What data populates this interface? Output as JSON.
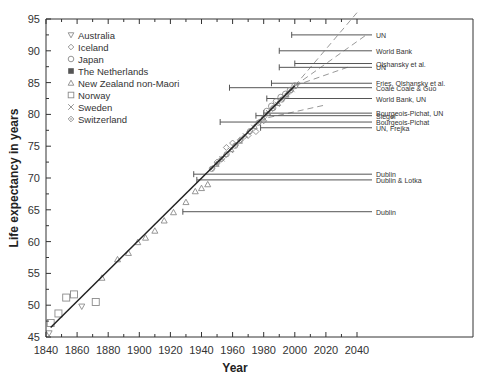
{
  "chart_data": {
    "type": "scatter",
    "title": "",
    "xlabel": "Year",
    "ylabel": "Life expectancy in years",
    "xlim": [
      1840,
      2040
    ],
    "ylim": [
      45,
      95
    ],
    "xticks": [
      1840,
      1860,
      1880,
      1900,
      1920,
      1940,
      1960,
      1980,
      2000,
      2020,
      2040
    ],
    "yticks": [
      45,
      50,
      55,
      60,
      65,
      70,
      75,
      80,
      85,
      90,
      95
    ],
    "grid": false,
    "legend_position": "upper-left",
    "legend": [
      {
        "name": "Australia",
        "marker": "triangle-down"
      },
      {
        "name": "Iceland",
        "marker": "diamond-open"
      },
      {
        "name": "Japan",
        "marker": "circle-open"
      },
      {
        "name": "The Netherlands",
        "marker": "square-filled"
      },
      {
        "name": "New Zealand non-Maori",
        "marker": "triangle-up"
      },
      {
        "name": "Norway",
        "marker": "square-open"
      },
      {
        "name": "Sweden",
        "marker": "x"
      },
      {
        "name": "Switzerland",
        "marker": "diamond-dot"
      }
    ],
    "trend_line": {
      "x": [
        1843,
        2000
      ],
      "y": [
        46.5,
        84.5
      ]
    },
    "series": [
      {
        "name": "Norway",
        "x": [
          1843,
          1848,
          1853,
          1858,
          1872
        ],
        "y": [
          47.2,
          48.7,
          51.2,
          51.7,
          50.5
        ]
      },
      {
        "name": "Australia",
        "x": [
          1842,
          1863
        ],
        "y": [
          45.6,
          49.8
        ]
      },
      {
        "name": "New Zealand non-Maori",
        "x": [
          1876,
          1886,
          1893,
          1899,
          1904,
          1910,
          1916,
          1922,
          1930,
          1936,
          1940,
          1944
        ],
        "y": [
          54.3,
          57.2,
          58.2,
          59.9,
          60.6,
          61.7,
          63.3,
          64.6,
          66.2,
          67.9,
          68.4,
          69.0
        ]
      },
      {
        "name": "Iceland",
        "x": [
          1950,
          1953,
          1956,
          1960,
          1965,
          1970,
          1975,
          1980
        ],
        "y": [
          72.5,
          73.0,
          74.8,
          75.5,
          76.0,
          76.7,
          77.3,
          79.0
        ]
      },
      {
        "name": "Japan",
        "x": [
          1982,
          1985,
          1988,
          1991,
          1994,
          1997,
          2000
        ],
        "y": [
          80.5,
          81.3,
          82.0,
          82.7,
          83.2,
          83.8,
          84.5
        ]
      }
    ],
    "projections": [
      {
        "label": "UN",
        "x_start": 1998,
        "level": 92.5
      },
      {
        "label": "World Bank",
        "x_start": 1990,
        "level": 90.0
      },
      {
        "label": "Olshansky et al.",
        "x_start": 2000,
        "level": 88.0
      },
      {
        "label": "UN",
        "x_start": 1990,
        "level": 87.4
      },
      {
        "label": "Fries, Olshansky et al.",
        "x_start": 1985,
        "level": 84.9
      },
      {
        "label": "Coale   Coale & Guo",
        "x_start": 1958,
        "level": 84.2
      },
      {
        "label": "World Bank, UN",
        "x_start": 1982,
        "level": 82.5
      },
      {
        "label": "Bourgeois-Pichat, UN",
        "x_start": 1980,
        "level": 80.2
      },
      {
        "label": "Siegel",
        "x_start": 1975,
        "level": 79.8
      },
      {
        "label": "Bourgeois-Pichat",
        "x_start": 1952,
        "level": 78.8
      },
      {
        "label": "UN, Frejka",
        "x_start": 1978,
        "level": 77.9
      },
      {
        "label": "Dublin",
        "x_start": 1935,
        "level": 70.6
      },
      {
        "label": "Dublin & Lotka",
        "x_start": 1937,
        "level": 69.7
      },
      {
        "label": "Dublin",
        "x_start": 1928,
        "level": 64.7
      }
    ],
    "dashed_extrapolations": [
      {
        "x": [
          2000,
          2040
        ],
        "y": [
          84.5,
          96
        ]
      },
      {
        "x": [
          2000,
          2046
        ],
        "y": [
          84.5,
          92.5
        ]
      },
      {
        "x": [
          2000,
          2035
        ],
        "y": [
          84.5,
          87.5
        ]
      },
      {
        "x": [
          1983,
          2020
        ],
        "y": [
          79.5,
          81.5
        ]
      }
    ]
  },
  "colors": {
    "axis": "#333333",
    "line": "#222222",
    "marker": "#8a8a8a",
    "projection": "#555555",
    "dashed": "#999999"
  }
}
